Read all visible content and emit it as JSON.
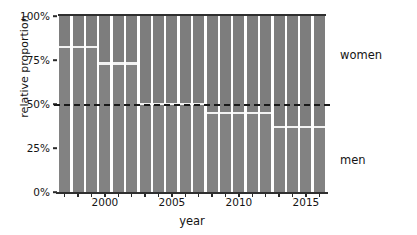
{
  "chart_data": {
    "type": "bar",
    "subtype": "stacked-proportion",
    "title": "",
    "xlabel": "year",
    "ylabel": "relative proportion",
    "xlim": [
      1996.5,
      2016.5
    ],
    "ylim": [
      0,
      100
    ],
    "grid": false,
    "legend_position": "right-inline",
    "y_tick_labels": [
      "0%",
      "25%",
      "50%",
      "75%",
      "100%"
    ],
    "y_tick_values": [
      0,
      25,
      50,
      75,
      100
    ],
    "x_tick_labels": [
      "2000",
      "2005",
      "2010",
      "2015"
    ],
    "x_tick_values": [
      2000,
      2005,
      2010,
      2015
    ],
    "categories": [
      1997,
      1998,
      1999,
      2000,
      2001,
      2002,
      2003,
      2004,
      2005,
      2006,
      2007,
      2008,
      2009,
      2010,
      2011,
      2012,
      2013,
      2014,
      2015,
      2016
    ],
    "series": [
      {
        "name": "women",
        "values": [
          17.5,
          17.5,
          17.5,
          27.0,
          27.0,
          27.0,
          50.0,
          50.0,
          50.0,
          50.0,
          50.0,
          55.0,
          55.0,
          55.0,
          55.0,
          55.0,
          63.0,
          63.0,
          63.0,
          63.0
        ]
      },
      {
        "name": "men",
        "values": [
          82.5,
          82.5,
          82.5,
          73.0,
          73.0,
          73.0,
          50.0,
          50.0,
          50.0,
          50.0,
          50.0,
          45.0,
          45.0,
          45.0,
          45.0,
          45.0,
          37.0,
          37.0,
          37.0,
          37.0
        ]
      }
    ],
    "divider_values_percent": [
      82.5,
      82.5,
      82.5,
      73.0,
      73.0,
      73.0,
      50.0,
      50.0,
      50.0,
      50.0,
      50.0,
      45.0,
      45.0,
      45.0,
      45.0,
      45.0,
      37.0,
      37.0,
      37.0,
      37.0
    ],
    "reference_line": {
      "value": 50,
      "style": "dashed",
      "color": "#1a1a1a"
    },
    "annotations": [
      {
        "text": "women",
        "region": "upper-right-outside"
      },
      {
        "text": "men",
        "region": "lower-right-outside"
      }
    ],
    "colors": {
      "bar": "#808080",
      "gap": "#ffffff",
      "divider": "#f2f2f2",
      "axis": "#2f2f2f",
      "text": "#141414"
    }
  },
  "labels": {
    "women": "women",
    "men": "men"
  }
}
